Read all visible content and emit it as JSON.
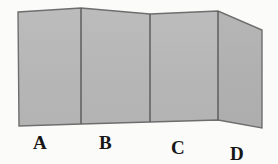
{
  "figure": {
    "background_color": "#fbfbfa",
    "panel_fill": "#b8b8b8",
    "panel_fill_shaded": "#b2b2b2",
    "edge_color": "#6e6e6e",
    "fold_color": "#5e5e5e",
    "label_color": "#161616"
  },
  "panels": [
    {
      "id": "panel-a",
      "label": "A",
      "label_x": 33,
      "label_y": 133,
      "points": "18,12 81,8 81,124 19,126",
      "fill": "#b8b8b8"
    },
    {
      "id": "panel-b",
      "label": "B",
      "label_x": 99,
      "label_y": 133,
      "points": "81,8 150,14 150,122 81,124",
      "fill": "#b8b8b8"
    },
    {
      "id": "panel-c",
      "label": "C",
      "label_x": 171,
      "label_y": 138,
      "points": "150,14 218,11 218,120 150,122",
      "fill": "#b8b8b8"
    },
    {
      "id": "panel-d",
      "label": "D",
      "label_x": 230,
      "label_y": 144,
      "points": "218,11 262,30 262,128 218,120",
      "fill": "#b2b2b2"
    }
  ],
  "folds": [
    {
      "id": "fold-ab",
      "x1": 81,
      "y1": 8,
      "x2": 81,
      "y2": 124
    },
    {
      "id": "fold-bc",
      "x1": 150,
      "y1": 14,
      "x2": 150,
      "y2": 122
    },
    {
      "id": "fold-cd",
      "x1": 218,
      "y1": 11,
      "x2": 218,
      "y2": 120
    }
  ],
  "outline": "18,12 81,8 150,14 218,11 262,30 262,128 218,120 150,122 81,124 19,126"
}
